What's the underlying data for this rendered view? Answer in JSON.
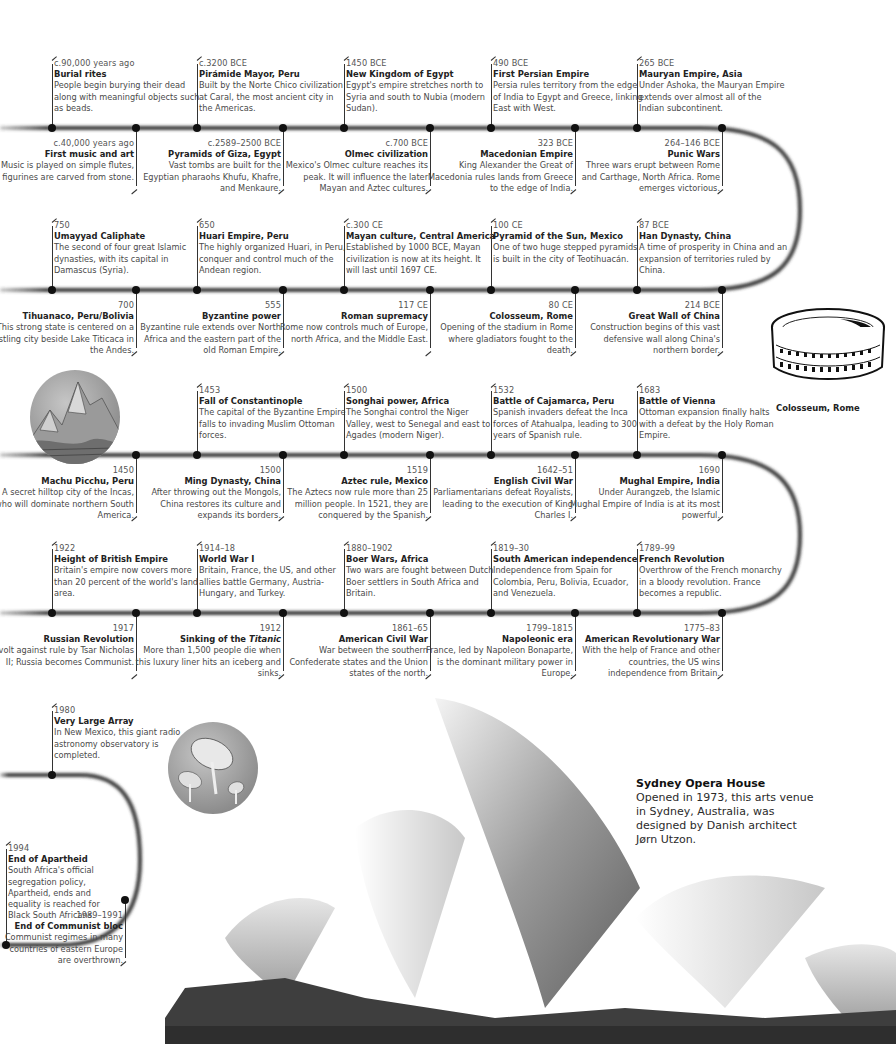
{
  "timeline": {
    "row1_top": [
      {
        "date": "c.90,000 years ago",
        "title": "Burial rites",
        "desc": "People begin burying their dead along with meaningful objects such as beads."
      },
      {
        "date": "c.3200 BCE",
        "title": "Pirámide Mayor, Peru",
        "desc": "Built by the Norte Chico civilization at Caral, the most ancient city in the Americas."
      },
      {
        "date": "1450 BCE",
        "title": "New Kingdom of Egypt",
        "desc": "Egypt's empire stretches north to Syria and south to Nubia (modern Sudan)."
      },
      {
        "date": "490 BCE",
        "title": "First Persian Empire",
        "desc": "Persia rules territory from the edge of India to Egypt and Greece, linking East with West."
      },
      {
        "date": "265 BCE",
        "title": "Mauryan Empire, Asia",
        "desc": "Under Ashoka, the Mauryan Empire extends over almost all of the Indian subcontinent."
      }
    ],
    "row1_bottom": [
      {
        "date": "c.40,000 years ago",
        "title": "First music and art",
        "desc": "Music is played on simple flutes, and figurines are carved from stone."
      },
      {
        "date": "c.2589–2500 BCE",
        "title": "Pyramids of Giza, Egypt",
        "desc": "Vast tombs are built for the Egyptian pharaohs Khufu, Khafre, and Menkaure."
      },
      {
        "date": "c.700 BCE",
        "title": "Olmec civilization",
        "desc": "Mexico's Olmec culture reaches its peak. It will influence the later Mayan and Aztec cultures."
      },
      {
        "date": "323 BCE",
        "title": "Macedonian Empire",
        "desc": "King Alexander the Great of Macedonia rules lands from Greece to the edge of India."
      },
      {
        "date": "264–146 BCE",
        "title": "Punic Wars",
        "desc": "Three wars erupt between Rome and Carthage, North Africa. Rome emerges victorious."
      }
    ],
    "row2_top": [
      {
        "date": "750",
        "title": "Umayyad Caliphate",
        "desc": "The second of four great Islamic dynasties, with its capital in Damascus (Syria)."
      },
      {
        "date": "650",
        "title": "Huari Empire, Peru",
        "desc": "The highly organized Huari, in Peru, conquer and control much of the Andean region."
      },
      {
        "date": "c.300 CE",
        "title": "Mayan culture, Central America",
        "desc": "Established by 1000 BCE, Mayan civilization is now at its height. It will last until 1697 CE."
      },
      {
        "date": "100 CE",
        "title": "Pyramid of the Sun, Mexico",
        "desc": "One of two huge stepped pyramids is built in the city of Teotihuacán."
      },
      {
        "date": "87 BCE",
        "title": "Han Dynasty, China",
        "desc": "A time of prosperity in China and an expansion of territories ruled by China."
      }
    ],
    "row2_bottom": [
      {
        "date": "700",
        "title": "Tihuanaco, Peru/Bolivia",
        "desc": "This strong state is centered on a bustling city beside Lake Titicaca in the Andes."
      },
      {
        "date": "555",
        "title": "Byzantine power",
        "desc": "Byzantine rule extends over North Africa and the eastern part of the old Roman Empire."
      },
      {
        "date": "117 CE",
        "title": "Roman supremacy",
        "desc": "Rome now controls much of Europe, north Africa, and the Middle East."
      },
      {
        "date": "80 CE",
        "title": "Colosseum, Rome",
        "desc": "Opening of the stadium in Rome where gladiators fought to the death."
      },
      {
        "date": "214 BCE",
        "title": "Great Wall of China",
        "desc": "Construction begins of this vast defensive wall along China's northern border."
      }
    ],
    "row3_top": [
      {
        "date": "1453",
        "title": "Fall of Constantinople",
        "desc": "The capital of the Byzantine Empire falls to invading Muslim Ottoman forces."
      },
      {
        "date": "1500",
        "title": "Songhai power, Africa",
        "desc": "The Songhai control the Niger Valley, west to Senegal and east to Agades (modern Niger)."
      },
      {
        "date": "1532",
        "title": "Battle of Cajamarca, Peru",
        "desc": "Spanish invaders defeat the Inca forces of Atahualpa, leading to 300 years of Spanish rule."
      },
      {
        "date": "1683",
        "title": "Battle of Vienna",
        "desc": "Ottoman expansion finally halts with a defeat by the Holy Roman Empire."
      }
    ],
    "row3_bottom": [
      {
        "date": "1450",
        "title": "Machu Picchu, Peru",
        "desc": "A secret hilltop city of the Incas, who will dominate northern South America."
      },
      {
        "date": "1500",
        "title": "Ming Dynasty, China",
        "desc": "After throwing out the Mongols, China restores its culture and expands its borders."
      },
      {
        "date": "1519",
        "title": "Aztec rule, Mexico",
        "desc": "The Aztecs now rule more than 25 million people. In 1521, they are conquered by the Spanish."
      },
      {
        "date": "1642–51",
        "title": "English Civil War",
        "desc": "Parliamentarians defeat Royalists, leading to the execution of King Charles I."
      },
      {
        "date": "1690",
        "title": "Mughal Empire, India",
        "desc": "Under Aurangzeb, the Islamic Mughal Empire of India is at its most powerful."
      }
    ],
    "row4_top": [
      {
        "date": "1922",
        "title": "Height of British Empire",
        "desc": "Britain's empire now covers more than 20 percent of the world's land area."
      },
      {
        "date": "1914–18",
        "title": "World War I",
        "desc": "Britain, France, the US, and other allies battle Germany, Austria-Hungary, and Turkey."
      },
      {
        "date": "1880–1902",
        "title": "Boer Wars, Africa",
        "desc": "Two wars are fought between Dutch Boer settlers in South Africa and Britain."
      },
      {
        "date": "1819–30",
        "title": "South American independence",
        "desc": "Independence from Spain for Colombia, Peru, Bolivia, Ecuador, and Venezuela."
      },
      {
        "date": "1789–99",
        "title": "French Revolution",
        "desc": "Overthrow of the French monarchy in a bloody revolution. France becomes a republic."
      }
    ],
    "row4_bottom": [
      {
        "date": "1917",
        "title": "Russian Revolution",
        "desc": "Revolt against rule by Tsar Nicholas II; Russia becomes Communist."
      },
      {
        "date": "1912",
        "title_prefix": "Sinking of the ",
        "title_italic": "Titanic",
        "desc": "More than 1,500 people die when this luxury liner hits an iceberg and sinks."
      },
      {
        "date": "1861–65",
        "title": "American Civil War",
        "desc": "War between the southern Confederate states and the Union states of the north."
      },
      {
        "date": "1799–1815",
        "title": "Napoleonic era",
        "desc": "France, led by Napoleon Bonaparte, is the dominant military power in Europe."
      },
      {
        "date": "1775–83",
        "title": "American Revolutionary War",
        "desc": "With the help of France and other countries, the US wins independence from Britain."
      }
    ],
    "row5_top": [
      {
        "date": "1980",
        "title": "Very Large Array",
        "desc": "In New Mexico, this giant radio astronomy observatory is completed."
      }
    ],
    "row6_top": [
      {
        "date": "1994",
        "title": "End of Apartheid",
        "desc": "South Africa's official segregation policy, Apartheid, ends and equality is reached for Black South Africans."
      }
    ],
    "row6_bottom": [
      {
        "date": "1989–1991",
        "title": "End of Communist bloc",
        "desc": "Communist regimes in many countries of eastern Europe are overthrown."
      }
    ]
  },
  "images": {
    "colosseum_label": "Colosseum, Rome",
    "sydney": {
      "title": "Sydney Opera House",
      "desc": "Opened in 1973, this arts venue in Sydney, Australia, was designed by Danish architect Jørn Utzon."
    }
  },
  "colors": {
    "track": "#3a3a3a",
    "dot": "#111111",
    "text": "#4a4a4a",
    "title": "#222222"
  }
}
